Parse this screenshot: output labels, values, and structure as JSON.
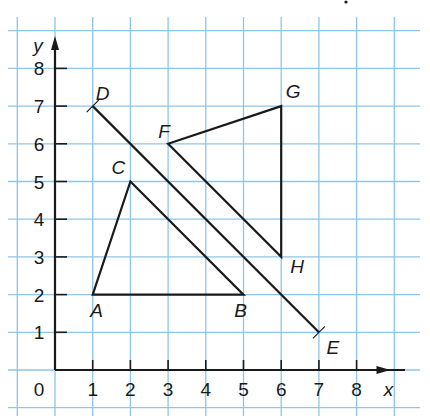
{
  "diagram": {
    "type": "coordinate_plane",
    "axes": {
      "x_label": "x",
      "y_label": "y",
      "origin_label": "0",
      "x_ticks": [
        "1",
        "2",
        "3",
        "4",
        "5",
        "6",
        "7",
        "8"
      ],
      "y_ticks": [
        "1",
        "2",
        "3",
        "4",
        "5",
        "6",
        "7",
        "8"
      ]
    },
    "colors": {
      "grid": "#8ec5e8",
      "ink": "#1a1a1a",
      "background": "#ffffff"
    },
    "points": [
      {
        "name": "A",
        "x": 1,
        "y": 2
      },
      {
        "name": "B",
        "x": 5,
        "y": 2
      },
      {
        "name": "C",
        "x": 2,
        "y": 5
      },
      {
        "name": "D",
        "x": 1,
        "y": 7
      },
      {
        "name": "E",
        "x": 7,
        "y": 1
      },
      {
        "name": "F",
        "x": 3,
        "y": 6
      },
      {
        "name": "G",
        "x": 6,
        "y": 7
      },
      {
        "name": "H",
        "x": 6,
        "y": 3
      }
    ],
    "triangles": [
      {
        "name": "ABC",
        "vertices": [
          "A",
          "B",
          "C"
        ]
      },
      {
        "name": "FGH",
        "vertices": [
          "F",
          "G",
          "H"
        ]
      }
    ],
    "line_of_reflection": {
      "name": "DE",
      "from": "D",
      "to": "E"
    }
  },
  "chart_data": {
    "type": "scatter",
    "title": "",
    "xlabel": "x",
    "ylabel": "y",
    "xlim": [
      0,
      8
    ],
    "ylim": [
      0,
      8
    ],
    "grid": true,
    "series": [
      {
        "name": "Triangle ABC",
        "x": [
          1,
          5,
          2,
          1
        ],
        "y": [
          2,
          2,
          5,
          2
        ]
      },
      {
        "name": "Triangle FGH",
        "x": [
          3,
          6,
          6,
          3
        ],
        "y": [
          6,
          7,
          3,
          6
        ]
      },
      {
        "name": "Segment DE",
        "x": [
          1,
          7
        ],
        "y": [
          7,
          1
        ]
      }
    ],
    "annotations": [
      "A",
      "B",
      "C",
      "D",
      "E",
      "F",
      "G",
      "H"
    ]
  }
}
